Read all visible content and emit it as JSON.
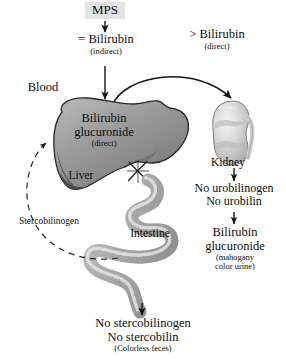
{
  "diagram": {
    "colors": {
      "liver_fill": "#8d8d8d",
      "liver_dark": "#545454",
      "kidney_fill": "#cfcfcf",
      "intestine_fill": "#b8b8b8",
      "mps_box_bg": "#e3e3e3",
      "stroke": "#1a1a1a",
      "text": "#0d0d0d"
    },
    "nodes": {
      "mps": {
        "label": "MPS"
      },
      "bilirubin_indirect": {
        "label": "= Bilirubin",
        "sub": "(indirect)"
      },
      "bilirubin_direct": {
        "label": "> Bilirubin",
        "sub": "(direct)"
      },
      "blood": {
        "label": "Blood"
      },
      "liver_contents": {
        "line1": "Bilirubin",
        "line2": "glucuronide",
        "sub": "(direct)"
      },
      "liver": {
        "label": "Liver"
      },
      "kidney": {
        "label": "Kidney"
      },
      "intestine": {
        "label": "Intestine"
      },
      "stercobilinogen": {
        "label": "Stercobilinogen"
      },
      "no_urobilin": {
        "line1": "No urobilinogen",
        "line2": "No urobilin"
      },
      "urine_product": {
        "line1": "Bilirubin",
        "line2": "glucuronide",
        "sub1": "(mahogany",
        "sub2": "color urine)"
      },
      "feces_product": {
        "line1": "No stercobilinogen",
        "line2": "No stercobilin",
        "sub": "(Colorless feces)"
      }
    },
    "markers": {
      "blockage": "blockage-x-mark"
    }
  }
}
